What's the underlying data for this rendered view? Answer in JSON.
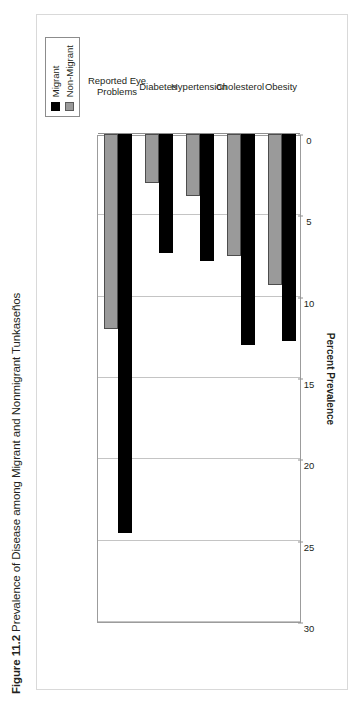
{
  "caption": {
    "figure_number": "Figure 11.2",
    "text": "Prevalence of Disease among Migrant and Nonmigrant Tunkaseños"
  },
  "legend": {
    "items": [
      {
        "label": "Migrant",
        "color": "#000000",
        "icon": "square-swatch"
      },
      {
        "label": "Non-Migrant",
        "color": "#9a9a9a",
        "icon": "square-swatch"
      }
    ]
  },
  "axis": {
    "title": "Percent Prevalence",
    "ticks": [
      "30",
      "25",
      "20",
      "15",
      "10",
      "5",
      "0"
    ]
  },
  "chart_data": {
    "type": "bar",
    "orientation": "horizontal",
    "title": "Figure 11.2 Prevalence of Disease among Migrant and Nonmigrant Tunkaseños",
    "xlabel": "Percent Prevalence",
    "ylabel": "",
    "xlim": [
      0,
      30
    ],
    "x_reversed": true,
    "grid": true,
    "legend_position": "top-right",
    "categories": [
      "Obesity",
      "Cholesterol",
      "Hypertension",
      "Diabetes",
      "Reported Eye Problems"
    ],
    "series": [
      {
        "name": "Migrant",
        "color": "#000000",
        "values": [
          12.7,
          13.0,
          7.8,
          7.3,
          24.5
        ]
      },
      {
        "name": "Non-Migrant",
        "color": "#9a9a9a",
        "values": [
          9.3,
          7.5,
          3.8,
          3.0,
          12.0
        ]
      }
    ],
    "tick_values": [
      30,
      25,
      20,
      15,
      10,
      5,
      0
    ]
  }
}
